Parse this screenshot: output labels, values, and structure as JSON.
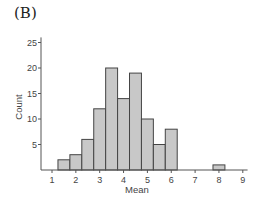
{
  "panel_label": "(B)",
  "chart_data": {
    "type": "bar",
    "subtype": "histogram",
    "title": "",
    "xlabel": "Mean",
    "ylabel": "Count",
    "xlim": [
      0.6,
      9.2
    ],
    "ylim": [
      0,
      26
    ],
    "xticks": [
      1,
      2,
      3,
      4,
      5,
      6,
      7,
      8,
      9
    ],
    "yticks": [
      5,
      10,
      15,
      20,
      25
    ],
    "grid": false,
    "legend": null,
    "bin_width": 0.5,
    "bins": [
      {
        "start": 1.25,
        "end": 1.75,
        "count": 2
      },
      {
        "start": 1.75,
        "end": 2.25,
        "count": 3
      },
      {
        "start": 2.25,
        "end": 2.75,
        "count": 6
      },
      {
        "start": 2.75,
        "end": 3.25,
        "count": 12
      },
      {
        "start": 3.25,
        "end": 3.75,
        "count": 20
      },
      {
        "start": 3.75,
        "end": 4.25,
        "count": 14
      },
      {
        "start": 4.25,
        "end": 4.75,
        "count": 19
      },
      {
        "start": 4.75,
        "end": 5.25,
        "count": 10
      },
      {
        "start": 5.25,
        "end": 5.75,
        "count": 5
      },
      {
        "start": 5.75,
        "end": 6.25,
        "count": 8
      },
      {
        "start": 7.75,
        "end": 8.25,
        "count": 1
      }
    ],
    "colors": {
      "bar_fill": "#c8c8c8",
      "bar_stroke": "#444444",
      "axis": "#555555"
    }
  }
}
